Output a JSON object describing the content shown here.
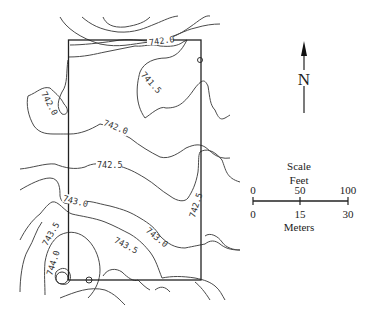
{
  "map": {
    "title": "",
    "contour_labels": [
      {
        "id": "c7420_top",
        "text": "742.0"
      },
      {
        "id": "c7415",
        "text": "741.5"
      },
      {
        "id": "c7420_left",
        "text": "742.0"
      },
      {
        "id": "c7420_mid",
        "text": "742.0"
      },
      {
        "id": "c7425_mid",
        "text": "742.5"
      },
      {
        "id": "c7425_right",
        "text": "742.5"
      },
      {
        "id": "c7430_left",
        "text": "743.0"
      },
      {
        "id": "c7430_right",
        "text": "743.0"
      },
      {
        "id": "c7435_left",
        "text": "743.5"
      },
      {
        "id": "c7435_mid",
        "text": "743.5"
      },
      {
        "id": "c7440",
        "text": "744.0"
      }
    ],
    "north_arrow": {
      "label": "N"
    },
    "scale": {
      "title": "Scale",
      "feet_label": "Feet",
      "feet_ticks": [
        "0",
        "50",
        "100"
      ],
      "meters_ticks": [
        "0",
        "15",
        "30"
      ],
      "meters_label": "Meters"
    },
    "colors": {
      "line": "#4a4a4a",
      "boundary": "#222222",
      "background": "#ffffff"
    }
  }
}
